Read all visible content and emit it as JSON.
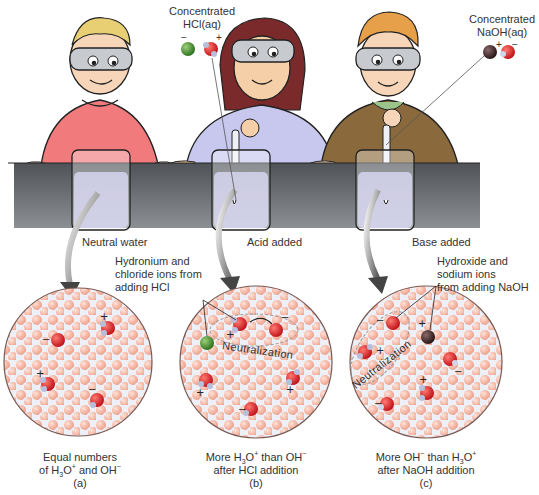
{
  "figure": {
    "panels": [
      {
        "id": "a",
        "beaker_label": "Neutral water",
        "caption_line1": "Equal numbers",
        "caption_line2_parts": [
          "of H",
          "3",
          "O",
          "+",
          " and OH",
          "−"
        ],
        "panel_letter": "(a)",
        "ions": {
          "hydronium": 2,
          "hydroxide": 2
        }
      },
      {
        "id": "b",
        "beaker_label": "Acid added",
        "reagent_label_line1": "Concentrated",
        "reagent_label_line2": "HCl(aq)",
        "reagent_charges": [
          "−",
          "+"
        ],
        "annotation": [
          "Hydronium and",
          "chloride ions from",
          "adding HCl"
        ],
        "reaction_label": "Neutralization",
        "caption_line1_parts": [
          "More H",
          "3",
          "O",
          "+",
          " than OH",
          "−"
        ],
        "caption_line2": "after HCl addition",
        "panel_letter": "(b)",
        "ions": {
          "hydronium": 3,
          "hydroxide": 2,
          "chloride": 1
        }
      },
      {
        "id": "c",
        "beaker_label": "Base added",
        "reagent_label_line1": "Concentrated",
        "reagent_label_line2": "NaOH(aq)",
        "reagent_charges": [
          "+",
          "−"
        ],
        "annotation": [
          "Hydroxide and",
          "sodium ions",
          "from adding NaOH"
        ],
        "reaction_label": "Neutralization",
        "caption_line1_parts": [
          "More OH",
          "−",
          " than H",
          "3",
          "O",
          "+"
        ],
        "caption_line2": "after NaOH addition",
        "panel_letter": "(c)",
        "ions": {
          "hydronium": 2,
          "hydroxide": 3,
          "sodium": 1
        }
      }
    ],
    "colors": {
      "water_molecule": "#f3b09c",
      "oxygen": "#d6232a",
      "hydrogen": "#9aa3c4",
      "chloride": "#4f9a34",
      "sodium": "#4a3030",
      "bench": "#5b5f63",
      "beaker_liquid": "#d7d6ee",
      "shirt_a": "#f0767a",
      "shirt_b": "#c9c8ee",
      "shirt_c": "#8a6a3c",
      "circle_border": "#7a5a55"
    }
  }
}
